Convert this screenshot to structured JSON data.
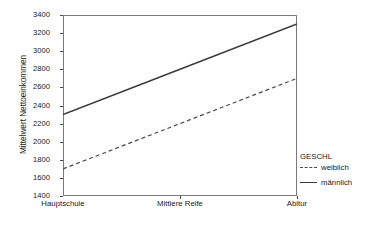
{
  "chart_data": {
    "type": "line",
    "title": "",
    "xlabel": "",
    "ylabel": "Mittelwert Nettoeinkommen",
    "categories": [
      "Hauptschule",
      "Mittlere Reife",
      "Abitur"
    ],
    "ylim": [
      1400,
      3400
    ],
    "yticks": [
      1400,
      1600,
      1800,
      2000,
      2200,
      2400,
      2600,
      2800,
      3000,
      3200,
      3400
    ],
    "grid": false,
    "legend_position": "right",
    "legend_title": "GESCHL",
    "series": [
      {
        "name": "weiblich",
        "style": "dashed",
        "color": "#4a4a4a",
        "values": [
          1700,
          2200,
          2700
        ]
      },
      {
        "name": "männlich",
        "style": "solid",
        "color": "#3a3a3a",
        "values": [
          2300,
          2800,
          3300
        ]
      }
    ]
  },
  "axes": {
    "y_title": "Mittelwert Nettoeinkommen",
    "y_tick_labels": [
      "3400",
      "3200",
      "3000",
      "2800",
      "2600",
      "2400",
      "2200",
      "2000",
      "1800",
      "1600",
      "1400"
    ],
    "x_tick_labels": [
      "Hauptschule",
      "Mittlere Reife",
      "Abitur"
    ]
  },
  "legend": {
    "title": "GESCHL",
    "entries": [
      {
        "label": "weiblich",
        "style": "dashed"
      },
      {
        "label": "männlich",
        "style": "solid"
      }
    ]
  }
}
